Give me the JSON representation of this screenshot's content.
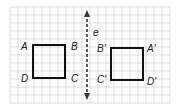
{
  "figure": {
    "type": "reflection-diagram",
    "grid": {
      "x0": 10,
      "y0": 7,
      "cols": 20,
      "rows": 12,
      "cell": 8,
      "color": "#c8c8c8"
    },
    "line": {
      "name": "e",
      "x": 87,
      "y1": 14,
      "y2": 96,
      "style": "dashed",
      "arrows": "both",
      "color": "#333333"
    },
    "original": {
      "name": "ABCD",
      "rect": {
        "x": 33,
        "y": 45,
        "w": 32,
        "h": 33
      },
      "labels": {
        "A": "A",
        "B": "B",
        "C": "C",
        "D": "D"
      },
      "stroke": "#111111"
    },
    "image": {
      "name": "A'B'C'D'",
      "rect": {
        "x": 111,
        "y": 48,
        "w": 32,
        "h": 32
      },
      "labels": {
        "A": "A'",
        "B": "B'",
        "C": "C'",
        "D": "D'"
      },
      "stroke": "#111111"
    }
  }
}
